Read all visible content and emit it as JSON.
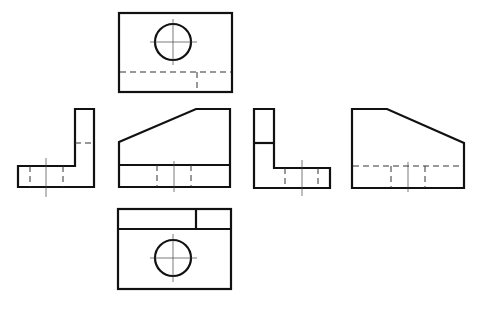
{
  "diagram": {
    "views": [
      {
        "name": "top-view",
        "features": [
          "rectangle outline",
          "circular hole with centerlines",
          "hidden edge line"
        ]
      },
      {
        "name": "left-side-view",
        "features": [
          "L profile",
          "hidden lines",
          "centerline"
        ]
      },
      {
        "name": "front-view",
        "features": [
          "sloped top edge",
          "base line",
          "hidden hole lines",
          "centerline"
        ]
      },
      {
        "name": "right-side-view",
        "features": [
          "L profile",
          "hidden lines",
          "centerline"
        ]
      },
      {
        "name": "rear-view",
        "features": [
          "sloped top edge",
          "hidden base line",
          "hidden hole lines",
          "centerline"
        ]
      },
      {
        "name": "bottom-view",
        "features": [
          "rectangle outline",
          "step edge",
          "circular hole with centerlines"
        ]
      }
    ]
  }
}
